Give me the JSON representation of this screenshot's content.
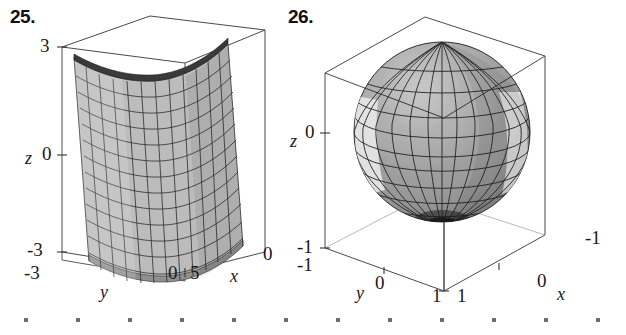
{
  "page": {
    "background": "#ffffff",
    "width": 626,
    "height": 335,
    "ink": "#1a1a1a"
  },
  "figures": [
    {
      "id": "fig-25",
      "number": "25.",
      "caption_name": "exercise-number-25",
      "surface_kind": "parabolic-cylinder",
      "surface_fill": "#b8b8b8",
      "mesh_color": "#2a2a2a",
      "box_color": "#4a4a4a",
      "axes": {
        "z": {
          "label": "z",
          "ticks": [
            "3",
            "0",
            "-3"
          ]
        },
        "y": {
          "label": "y",
          "ticks": [
            "-3",
            "0"
          ]
        },
        "x": {
          "label": "x",
          "ticks": [
            "5",
            "0"
          ]
        }
      }
    },
    {
      "id": "fig-26",
      "number": "26.",
      "caption_name": "exercise-number-26",
      "surface_kind": "sphere",
      "surface_fill": "#9d9d9d",
      "surface_highlight": "#e8e8e8",
      "mesh_color": "#222222",
      "box_color": "#4a4a4a",
      "axes": {
        "z": {
          "label": "z",
          "ticks": [
            "0",
            "-1"
          ]
        },
        "y": {
          "label": "y",
          "ticks": [
            "-1",
            "0",
            "1"
          ]
        },
        "x": {
          "label": "x",
          "ticks": [
            "1",
            "0",
            "-1"
          ]
        }
      }
    }
  ],
  "chart_data": [
    {
      "type": "surface3d",
      "title": "25.",
      "description": "Parabolic-cylinder surface x = y^2 drawn inside a 3-D bounding box; surface is shaded gray with a rectangular wireframe mesh and is independent of z (a cylinder along the z-axis).",
      "xlabel": "x",
      "ylabel": "y",
      "zlabel": "z",
      "xlim": [
        0,
        5
      ],
      "ylim": [
        -3,
        3
      ],
      "zlim": [
        -3,
        3
      ],
      "xticks": [
        5,
        0
      ],
      "yticks": [
        -3,
        0
      ],
      "zticks": [
        -3,
        0,
        3
      ],
      "xticklabels": [
        "5",
        "0"
      ],
      "yticklabels": [
        "-3",
        "0"
      ],
      "zticklabels": [
        "-3",
        "0",
        "3"
      ],
      "grid": true,
      "legend": false,
      "mesh_u_lines": 13,
      "mesh_v_lines": 13
    },
    {
      "type": "surface3d",
      "title": "26.",
      "description": "Unit sphere x^2 + y^2 + z^2 = 1 drawn inside a cubic bounding box; shaded gray with a latitude/longitude wireframe mesh converging at the bottom pole.",
      "xlabel": "x",
      "ylabel": "y",
      "zlabel": "z",
      "xlim": [
        1,
        -1
      ],
      "ylim": [
        -1,
        1
      ],
      "zlim": [
        -1,
        1
      ],
      "xticks": [
        1,
        0,
        -1
      ],
      "yticks": [
        -1,
        0,
        1
      ],
      "zticks": [
        -1,
        0
      ],
      "xticklabels": [
        "1",
        "0",
        "-1"
      ],
      "yticklabels": [
        "-1",
        "0",
        "1"
      ],
      "zticklabels": [
        "-1",
        "0"
      ],
      "grid": true,
      "legend": false,
      "mesh_lat_lines": 14,
      "mesh_lon_lines": 16
    }
  ],
  "footer": {
    "dot_row_name": "page-dot-rule",
    "dot_count": 12,
    "dot_color": "#6d6d6d"
  }
}
